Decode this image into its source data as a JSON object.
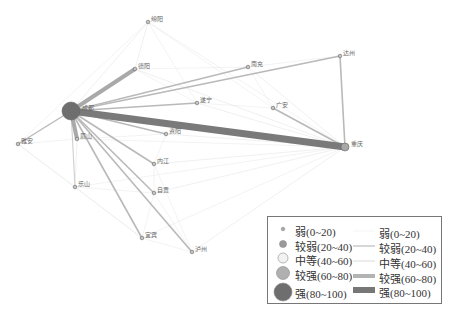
{
  "diagram": {
    "type": "network",
    "nodes": [
      {
        "id": "chengdu",
        "label": "成都",
        "x": 71,
        "y": 111,
        "r": 9,
        "level": 4
      },
      {
        "id": "chongqing",
        "label": "重庆",
        "x": 345,
        "y": 147,
        "r": 4,
        "level": 3
      },
      {
        "id": "mianyang",
        "label": "绵阳",
        "x": 148,
        "y": 22,
        "r": 1.8,
        "level": 1
      },
      {
        "id": "deyang",
        "label": "德阳",
        "x": 135,
        "y": 69,
        "r": 1.8,
        "level": 1
      },
      {
        "id": "nanchong",
        "label": "南充",
        "x": 248,
        "y": 67,
        "r": 1.8,
        "level": 1
      },
      {
        "id": "dazhou",
        "label": "达州",
        "x": 340,
        "y": 56,
        "r": 1.8,
        "level": 1
      },
      {
        "id": "suining",
        "label": "遂宁",
        "x": 197,
        "y": 103,
        "r": 1.8,
        "level": 1
      },
      {
        "id": "guangan",
        "label": "广安",
        "x": 273,
        "y": 108,
        "r": 1.8,
        "level": 1
      },
      {
        "id": "ziyang",
        "label": "资阳",
        "x": 166,
        "y": 134,
        "r": 1.8,
        "level": 1
      },
      {
        "id": "yaan",
        "label": "雅安",
        "x": 18,
        "y": 144,
        "r": 1.8,
        "level": 1
      },
      {
        "id": "meishan",
        "label": "眉山",
        "x": 77,
        "y": 139,
        "r": 1.8,
        "level": 1
      },
      {
        "id": "neijiang",
        "label": "内江",
        "x": 154,
        "y": 164,
        "r": 1.8,
        "level": 1
      },
      {
        "id": "leshan",
        "label": "乐山",
        "x": 75,
        "y": 187,
        "r": 1.8,
        "level": 1
      },
      {
        "id": "zigong",
        "label": "自贡",
        "x": 154,
        "y": 193,
        "r": 1.8,
        "level": 1
      },
      {
        "id": "yibin",
        "label": "宜宾",
        "x": 142,
        "y": 238,
        "r": 1.8,
        "level": 1
      },
      {
        "id": "luzhou",
        "label": "泸州",
        "x": 192,
        "y": 252,
        "r": 1.8,
        "level": 1
      }
    ],
    "edges": [
      {
        "from": "chengdu",
        "to": "chongqing",
        "level": 5,
        "width": 7
      },
      {
        "from": "chengdu",
        "to": "deyang",
        "level": 4,
        "width": 4
      },
      {
        "from": "chengdu",
        "to": "meishan",
        "level": 4,
        "width": 4
      },
      {
        "from": "chengdu",
        "to": "dazhou",
        "level": 2,
        "width": 1.6
      },
      {
        "from": "chengdu",
        "to": "suining",
        "level": 2,
        "width": 1.6
      },
      {
        "from": "chengdu",
        "to": "yaan",
        "level": 2,
        "width": 1.4
      },
      {
        "from": "chengdu",
        "to": "neijiang",
        "level": 2,
        "width": 1.6
      },
      {
        "from": "chengdu",
        "to": "zigong",
        "level": 2,
        "width": 1.6
      },
      {
        "from": "chengdu",
        "to": "yibin",
        "level": 2,
        "width": 1.6
      },
      {
        "from": "chengdu",
        "to": "luzhou",
        "level": 2,
        "width": 1.6
      },
      {
        "from": "chengdu",
        "to": "ziyang",
        "level": 2,
        "width": 1.3
      },
      {
        "from": "chengdu",
        "to": "nanchong",
        "level": 2,
        "width": 1.3
      },
      {
        "from": "chengdu",
        "to": "leshan",
        "level": 3,
        "width": 1.1
      },
      {
        "from": "chengdu",
        "to": "mianyang",
        "level": 1,
        "width": 0.6
      },
      {
        "from": "chongqing",
        "to": "dazhou",
        "level": 2,
        "width": 1.6
      },
      {
        "from": "chongqing",
        "to": "guangan",
        "level": 2,
        "width": 1.6
      },
      {
        "from": "chongqing",
        "to": "nanchong",
        "level": 1,
        "width": 0.6
      },
      {
        "from": "chongqing",
        "to": "suining",
        "level": 1,
        "width": 0.6
      },
      {
        "from": "chongqing",
        "to": "ziyang",
        "level": 1,
        "width": 0.6
      },
      {
        "from": "chongqing",
        "to": "neijiang",
        "level": 1,
        "width": 0.6
      },
      {
        "from": "chongqing",
        "to": "zigong",
        "level": 1,
        "width": 0.6
      },
      {
        "from": "chongqing",
        "to": "luzhou",
        "level": 1,
        "width": 0.6
      },
      {
        "from": "chongqing",
        "to": "yibin",
        "level": 1,
        "width": 0.5
      },
      {
        "from": "chongqing",
        "to": "deyang",
        "level": 1,
        "width": 0.6
      },
      {
        "from": "chongqing",
        "to": "mianyang",
        "level": 1,
        "width": 0.5
      },
      {
        "from": "chongqing",
        "to": "meishan",
        "level": 1,
        "width": 0.5
      },
      {
        "from": "chongqing",
        "to": "leshan",
        "level": 1,
        "width": 0.5
      },
      {
        "from": "mianyang",
        "to": "deyang",
        "level": 1,
        "width": 0.6
      },
      {
        "from": "mianyang",
        "to": "yaan",
        "level": 1,
        "width": 0.5
      },
      {
        "from": "mianyang",
        "to": "suining",
        "level": 1,
        "width": 0.5
      },
      {
        "from": "mianyang",
        "to": "guangan",
        "level": 1,
        "width": 0.5
      },
      {
        "from": "deyang",
        "to": "suining",
        "level": 1,
        "width": 0.5
      },
      {
        "from": "deyang",
        "to": "nanchong",
        "level": 1,
        "width": 0.5
      },
      {
        "from": "nanchong",
        "to": "dazhou",
        "level": 1,
        "width": 0.5
      },
      {
        "from": "nanchong",
        "to": "guangan",
        "level": 1,
        "width": 0.5
      },
      {
        "from": "suining",
        "to": "guangan",
        "level": 1,
        "width": 0.5
      },
      {
        "from": "yaan",
        "to": "meishan",
        "level": 1,
        "width": 0.5
      },
      {
        "from": "yaan",
        "to": "leshan",
        "level": 1,
        "width": 0.5
      },
      {
        "from": "yaan",
        "to": "yibin",
        "level": 1,
        "width": 0.5
      },
      {
        "from": "meishan",
        "to": "leshan",
        "level": 1,
        "width": 0.6
      },
      {
        "from": "meishan",
        "to": "ziyang",
        "level": 1,
        "width": 0.5
      },
      {
        "from": "leshan",
        "to": "zigong",
        "level": 1,
        "width": 0.5
      },
      {
        "from": "leshan",
        "to": "yibin",
        "level": 1,
        "width": 0.5
      },
      {
        "from": "neijiang",
        "to": "zigong",
        "level": 1,
        "width": 0.5
      },
      {
        "from": "neijiang",
        "to": "ziyang",
        "level": 1,
        "width": 0.5
      },
      {
        "from": "zigong",
        "to": "yibin",
        "level": 1,
        "width": 0.5
      },
      {
        "from": "zigong",
        "to": "luzhou",
        "level": 1,
        "width": 0.5
      },
      {
        "from": "yibin",
        "to": "luzhou",
        "level": 1,
        "width": 0.5
      },
      {
        "from": "neijiang",
        "to": "luzhou",
        "level": 1,
        "width": 0.5
      }
    ]
  },
  "colors": {
    "strong": "#777777",
    "fairly_strong": "#b5b5b5",
    "medium": "#e8e8e8",
    "fairly_weak": "#c8c8c8",
    "weak": "#eeeeee",
    "node_fill": "#8c8c8c",
    "node_stroke": "#666666"
  },
  "legend": {
    "nodes": [
      {
        "label": "弱(0~20)",
        "r": 1.8,
        "fill": "#aaaaaa"
      },
      {
        "label": "较弱(20~40)",
        "r": 3.5,
        "fill": "#9a9a9a"
      },
      {
        "label": "中等(40~60)",
        "r": 5,
        "fill": "#f2f2f2"
      },
      {
        "label": "较强(60~80)",
        "r": 6.5,
        "fill": "#b0b0b0"
      },
      {
        "label": "强(80~100)",
        "r": 9,
        "fill": "#6e6e6e"
      }
    ],
    "edges": [
      {
        "label": "弱(0~20)",
        "width": 0.6,
        "color": "#eeeeee"
      },
      {
        "label": "较弱(20~40)",
        "width": 1.2,
        "color": "#bdbdbd"
      },
      {
        "label": "中等(40~60)",
        "width": 2,
        "color": "#ececec"
      },
      {
        "label": "较强(60~80)",
        "width": 4,
        "color": "#b3b3b3"
      },
      {
        "label": "强(80~100)",
        "width": 6,
        "color": "#777777"
      }
    ]
  }
}
